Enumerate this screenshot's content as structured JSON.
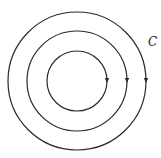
{
  "diagram": {
    "type": "concentric-circles",
    "center": {
      "x": 77,
      "y": 81
    },
    "stroke_color": "#2a2a2a",
    "circles": [
      {
        "name": "inner",
        "radius": 30,
        "direction": "clockwise",
        "arrow_at": "right"
      },
      {
        "name": "middle",
        "radius": 50,
        "direction": "clockwise",
        "arrow_at": "right"
      },
      {
        "name": "outer",
        "radius": 69,
        "direction": "clockwise",
        "arrow_at": "right"
      }
    ],
    "label": {
      "text": "C",
      "x": 148,
      "y": 46
    }
  }
}
